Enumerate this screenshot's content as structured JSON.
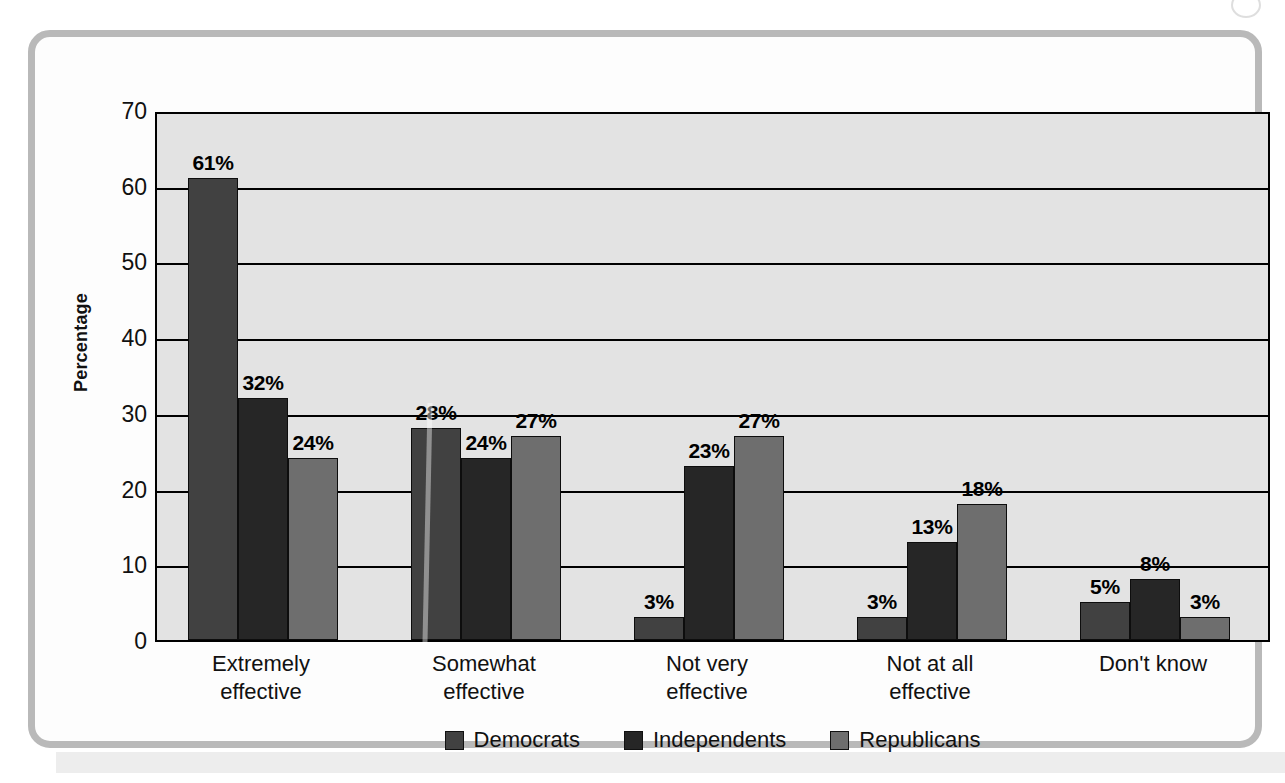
{
  "chart_data": {
    "type": "bar",
    "title": "",
    "xlabel": "",
    "ylabel": "Percentage",
    "ylim": [
      0,
      70
    ],
    "yticks": [
      70,
      60,
      50,
      40,
      30,
      20,
      10,
      0
    ],
    "grid": true,
    "legend_position": "bottom",
    "categories": [
      "Extremely effective",
      "Somewhat effective",
      "Not very effective",
      "Not at all effective",
      "Don't know"
    ],
    "category_lines": [
      [
        "Extremely",
        "effective"
      ],
      [
        "Somewhat",
        "effective"
      ],
      [
        "Not very",
        "effective"
      ],
      [
        "Not at all",
        "effective"
      ],
      [
        "Don't know",
        ""
      ]
    ],
    "series": [
      {
        "name": "Democrats",
        "color": "#414141",
        "values": [
          61,
          28,
          3,
          3,
          5
        ],
        "labels": [
          "61%",
          "28%",
          "3%",
          "3%",
          "5%"
        ]
      },
      {
        "name": "Independents",
        "color": "#262626",
        "values": [
          32,
          24,
          23,
          13,
          8
        ],
        "labels": [
          "32%",
          "24%",
          "23%",
          "13%",
          "8%"
        ]
      },
      {
        "name": "Republicans",
        "color": "#6e6e6e",
        "values": [
          24,
          27,
          27,
          18,
          3
        ],
        "labels": [
          "24%",
          "27%",
          "27%",
          "18%",
          "3%"
        ]
      }
    ]
  },
  "colors": {
    "plot_background": "#e3e3e3",
    "frame_border": "#b9b9b9",
    "axis": "#000000",
    "democrats": "#414141",
    "independents": "#262626",
    "republicans": "#6e6e6e"
  }
}
